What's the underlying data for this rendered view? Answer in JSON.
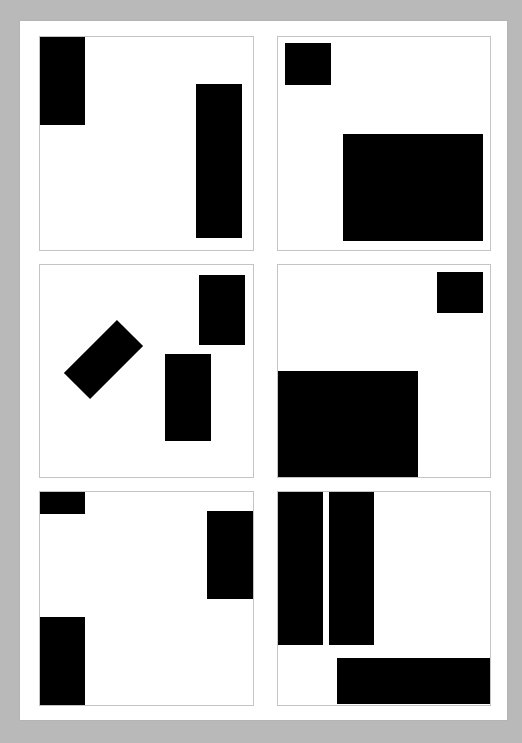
{
  "page": {
    "background": "#b9b9b9",
    "paper_color": "#ffffff",
    "panel_border_color": "#c4c4c4",
    "block_color": "#000000"
  },
  "panels": [
    {
      "id": "panel-1",
      "position": "row-1-left",
      "box": {
        "x": 39,
        "y": 36,
        "w": 215,
        "h": 215
      },
      "blocks": [
        {
          "x": 39,
          "y": 36,
          "w": 46,
          "h": 89,
          "rotate": 0
        },
        {
          "x": 196,
          "y": 84,
          "w": 46,
          "h": 154,
          "rotate": 0
        }
      ]
    },
    {
      "id": "panel-2",
      "position": "row-1-right",
      "box": {
        "x": 277,
        "y": 36,
        "w": 214,
        "h": 215
      },
      "blocks": [
        {
          "x": 285,
          "y": 43,
          "w": 46,
          "h": 42,
          "rotate": 0
        },
        {
          "x": 343,
          "y": 134,
          "w": 140,
          "h": 107,
          "rotate": 0
        }
      ]
    },
    {
      "id": "panel-3",
      "position": "row-2-left",
      "box": {
        "x": 39,
        "y": 264,
        "w": 215,
        "h": 214
      },
      "blocks": [
        {
          "x": 66,
          "y": 341,
          "w": 75,
          "h": 37,
          "rotate": -45
        },
        {
          "x": 199,
          "y": 275,
          "w": 46,
          "h": 70,
          "rotate": 0
        },
        {
          "x": 165,
          "y": 354,
          "w": 46,
          "h": 87,
          "rotate": 0
        }
      ]
    },
    {
      "id": "panel-4",
      "position": "row-2-right",
      "box": {
        "x": 277,
        "y": 264,
        "w": 214,
        "h": 214
      },
      "blocks": [
        {
          "x": 437,
          "y": 272,
          "w": 46,
          "h": 41,
          "rotate": 0
        },
        {
          "x": 277,
          "y": 371,
          "w": 141,
          "h": 107,
          "rotate": 0
        }
      ]
    },
    {
      "id": "panel-5",
      "position": "row-3-left",
      "box": {
        "x": 39,
        "y": 491,
        "w": 215,
        "h": 215
      },
      "blocks": [
        {
          "x": 39,
          "y": 491,
          "w": 46,
          "h": 23,
          "rotate": 0
        },
        {
          "x": 207,
          "y": 511,
          "w": 46,
          "h": 88,
          "rotate": 0
        },
        {
          "x": 39,
          "y": 617,
          "w": 46,
          "h": 88,
          "rotate": 0
        }
      ]
    },
    {
      "id": "panel-6",
      "position": "row-3-right",
      "box": {
        "x": 277,
        "y": 491,
        "w": 214,
        "h": 215
      },
      "blocks": [
        {
          "x": 277,
          "y": 491,
          "w": 46,
          "h": 154,
          "rotate": 0
        },
        {
          "x": 329,
          "y": 491,
          "w": 45,
          "h": 154,
          "rotate": 0
        },
        {
          "x": 337,
          "y": 658,
          "w": 153,
          "h": 46,
          "rotate": 0
        }
      ]
    }
  ]
}
